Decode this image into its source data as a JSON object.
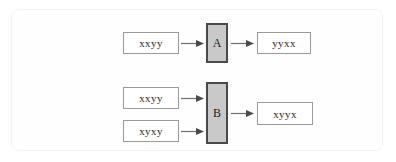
{
  "figure": {
    "border_color": "#f4f4f4",
    "background_color": "#fefefe"
  },
  "colors": {
    "process_fill": "#c9c9c9",
    "process_border": "#4a4a4a",
    "string_box_border": "#9a9a9a",
    "string_box_fill": "#ffffff",
    "arrow_color": "#6e6e6e",
    "text_color": "#2b2b2b"
  },
  "diagrams": [
    {
      "id": "diagram-a",
      "process_label": "A",
      "inputs": [
        {
          "label": "xxyy"
        }
      ],
      "outputs": [
        {
          "label": "yyxx"
        }
      ]
    },
    {
      "id": "diagram-b",
      "process_label": "B",
      "inputs": [
        {
          "label": "xxyy"
        },
        {
          "label": "xyxy"
        }
      ],
      "outputs": [
        {
          "label": "xyyx"
        }
      ]
    }
  ]
}
